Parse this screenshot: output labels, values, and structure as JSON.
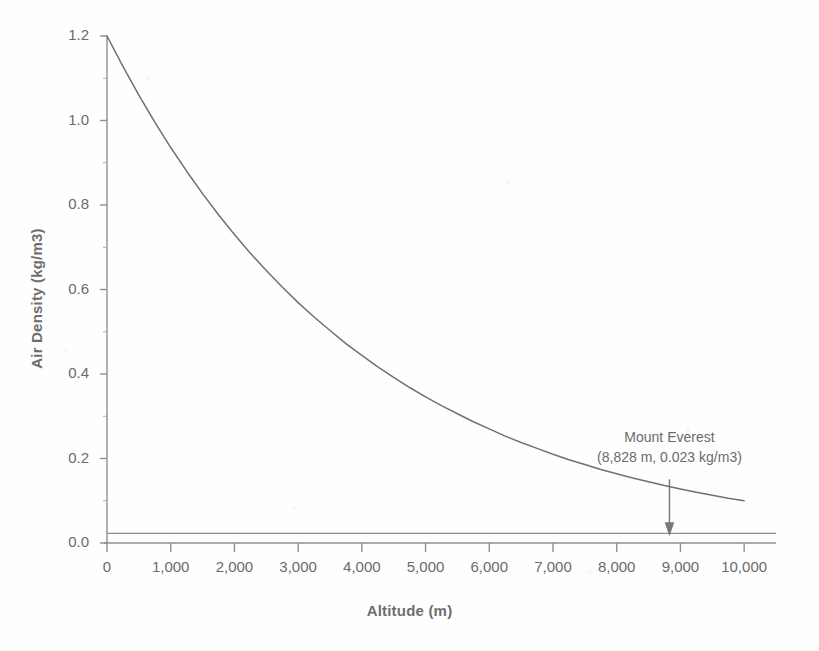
{
  "figure": {
    "background_color": "#fefefe",
    "ink_color": "#707070",
    "width": 819,
    "height": 651
  },
  "axes": {
    "x_title": "Altitude (m)",
    "y_title": "Air Density (kg/m3)",
    "x_tick_labels": [
      "0",
      "1,000",
      "2,000",
      "3,000",
      "4,000",
      "5,000",
      "6,000",
      "7,000",
      "8,000",
      "9,000",
      "10,000"
    ],
    "y_tick_labels": [
      "0.0",
      "0.2",
      "0.4",
      "0.6",
      "0.8",
      "1.0",
      "1.2"
    ]
  },
  "annotation": {
    "line1": "Mount Everest",
    "line2": "(8,828 m, 0.023 kg/m3)",
    "arrow_name": "down-arrow-icon"
  },
  "chart_data": {
    "type": "line",
    "title": "",
    "subtitle": "",
    "xlabel": "Altitude (m)",
    "ylabel": "Air Density (kg/m3)",
    "xlim": [
      0,
      10500
    ],
    "ylim": [
      0.0,
      1.2
    ],
    "grid": false,
    "legend": "none",
    "x_ticks": [
      0,
      1000,
      2000,
      3000,
      4000,
      5000,
      6000,
      7000,
      8000,
      9000,
      10000
    ],
    "x_tick_labels": [
      "0",
      "1,000",
      "2,000",
      "3,000",
      "4,000",
      "5,000",
      "6,000",
      "7,000",
      "8,000",
      "9,000",
      "10,000"
    ],
    "y_ticks": [
      0.0,
      0.2,
      0.4,
      0.6,
      0.8,
      1.0,
      1.2
    ],
    "y_tick_labels": [
      "0.0",
      "0.2",
      "0.4",
      "0.6",
      "0.8",
      "1.0",
      "1.2"
    ],
    "y_minor_ticks": [
      0.1,
      0.3,
      0.5,
      0.7,
      0.9,
      1.1
    ],
    "series": [
      {
        "name": "Air density vs altitude",
        "color": "#707070",
        "x": [
          0,
          250,
          500,
          750,
          1000,
          1250,
          1500,
          1750,
          2000,
          2250,
          2500,
          2750,
          3000,
          3250,
          3500,
          3750,
          4000,
          4250,
          4500,
          4750,
          5000,
          5250,
          5500,
          5750,
          6000,
          6250,
          6500,
          6750,
          7000,
          7250,
          7500,
          7750,
          8000,
          8250,
          8500,
          8750,
          9000,
          9250,
          9500,
          9750,
          10000
        ],
        "y": [
          1.2,
          1.128,
          1.06,
          0.996,
          0.936,
          0.88,
          0.827,
          0.777,
          0.73,
          0.686,
          0.645,
          0.606,
          0.569,
          0.535,
          0.503,
          0.472,
          0.444,
          0.417,
          0.392,
          0.368,
          0.346,
          0.325,
          0.306,
          0.287,
          0.27,
          0.253,
          0.238,
          0.224,
          0.21,
          0.197,
          0.186,
          0.174,
          0.164,
          0.154,
          0.145,
          0.136,
          0.128,
          0.12,
          0.113,
          0.106,
          0.1
        ]
      }
    ],
    "reference_lines": [
      {
        "name": "everest-density-line",
        "orientation": "horizontal",
        "value": 0.023,
        "color": "#8c8c8c"
      }
    ],
    "annotations": [
      {
        "name": "mount-everest-annotation",
        "text": "Mount Everest\n(8,828 m, 0.023 kg/m3)",
        "x": 8828,
        "y": 0.023,
        "arrow": "down"
      }
    ]
  }
}
